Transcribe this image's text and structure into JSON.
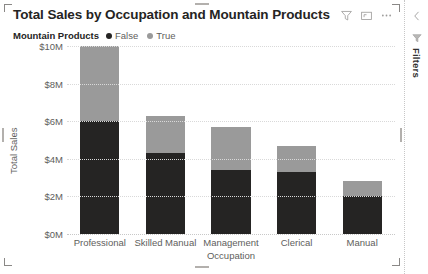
{
  "visual": {
    "title": "Total Sales by Occupation and Mountain Products",
    "header_actions": [
      {
        "name": "filter-icon",
        "label": "Filters"
      },
      {
        "name": "focus-mode-icon",
        "label": "Focus mode"
      },
      {
        "name": "more-options-icon",
        "label": "More options"
      }
    ]
  },
  "legend": {
    "title": "Mountain Products",
    "items": [
      {
        "label": "False",
        "color": "#252423"
      },
      {
        "label": "True",
        "color": "#9a9a9a"
      }
    ]
  },
  "filters_pane": {
    "label": "Filters",
    "collapse_icon": "chevron-left-icon",
    "funnel_icon": "filter-icon"
  },
  "chart_data": {
    "type": "bar",
    "stacked": true,
    "title": "Total Sales by Occupation and Mountain Products",
    "xlabel": "Occupation",
    "ylabel": "Total Sales",
    "categories": [
      "Professional",
      "Skilled Manual",
      "Management",
      "Clerical",
      "Manual"
    ],
    "series": [
      {
        "name": "False",
        "color": "#252423",
        "values": [
          6.0,
          4.3,
          3.4,
          3.3,
          2.0
        ]
      },
      {
        "name": "True",
        "color": "#9a9a9a",
        "values": [
          4.0,
          2.0,
          2.3,
          1.4,
          0.8
        ]
      }
    ],
    "totals": [
      10.0,
      6.3,
      5.7,
      4.7,
      2.8
    ],
    "ylim": [
      0,
      10
    ],
    "ytick_values": [
      0,
      2,
      4,
      6,
      8,
      10
    ],
    "ytick_labels": [
      "$0M",
      "$2M",
      "$4M",
      "$6M",
      "$8M",
      "$10M"
    ],
    "grid": true,
    "legend_position": "top-left",
    "value_unit": "millions USD"
  }
}
